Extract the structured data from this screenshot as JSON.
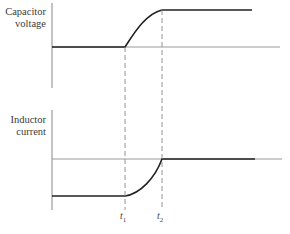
{
  "diagram": {
    "top_plot": {
      "ylabel_line1": "Capacitor",
      "ylabel_line2": "voltage"
    },
    "bottom_plot": {
      "ylabel_line1": "Inductor",
      "ylabel_line2": "current"
    },
    "time_markers": [
      {
        "symbol": "t",
        "subscript": "1"
      },
      {
        "symbol": "t",
        "subscript": "2"
      }
    ],
    "colors": {
      "curve": "#222222",
      "axis": "#9a9a9a",
      "dashed": "#888888"
    }
  }
}
